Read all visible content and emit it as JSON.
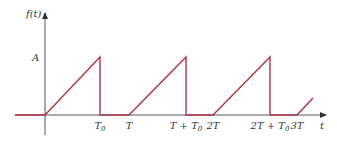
{
  "diagram": {
    "y_axis_label": "f(t)",
    "x_axis_label": "t",
    "amplitude_label": "A",
    "tick_labels": [
      {
        "main": "T",
        "sub": "0",
        "x": 100
      },
      {
        "main": "T",
        "sub": "",
        "x": 129
      },
      {
        "main": "T + T",
        "sub": "0",
        "x": 186
      },
      {
        "main": "2T",
        "sub": "",
        "x": 213
      },
      {
        "main": "2T + T",
        "sub": "0",
        "x": 270
      },
      {
        "main": "3T",
        "sub": "",
        "x": 297
      }
    ],
    "colors": {
      "axis": "#333333",
      "signal": "#b0334a"
    },
    "waveform": {
      "description": "Linear ramp from 0 to A over [nT, nT+T0], drop to 0, stay 0 until (n+1)T",
      "points": [
        [
          15,
          115
        ],
        [
          45,
          115
        ],
        [
          100,
          57
        ],
        [
          100,
          115
        ],
        [
          129,
          115
        ],
        [
          186,
          57
        ],
        [
          186,
          115
        ],
        [
          213,
          115
        ],
        [
          270,
          57
        ],
        [
          270,
          115
        ],
        [
          297,
          115
        ],
        [
          313,
          98
        ]
      ]
    }
  }
}
